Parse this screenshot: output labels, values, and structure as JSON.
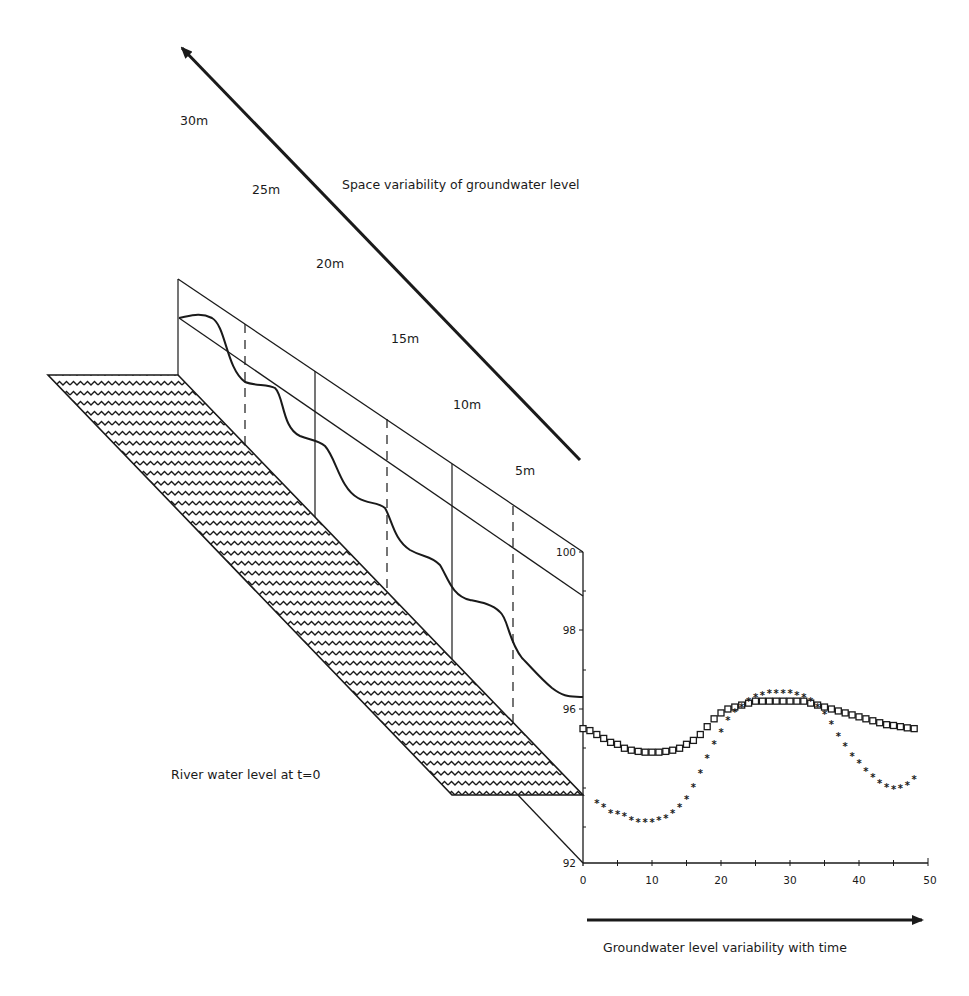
{
  "figure": {
    "top_arrow_label": "Space variability of groundwater level",
    "bottom_arrow_label": "Groundwater level variability with time",
    "river_label": "River water level at t=0",
    "distance_markers": [
      {
        "label": "30m",
        "x": 178,
        "line": "solid"
      },
      {
        "label": "25m",
        "x": 245,
        "line": "dashed"
      },
      {
        "label": "20m",
        "x": 315,
        "line": "solid"
      },
      {
        "label": "15m",
        "x": 387,
        "line": "dashed"
      },
      {
        "label": "10m",
        "x": 452,
        "line": "solid"
      },
      {
        "label": "5m",
        "x": 513,
        "line": "dashed"
      }
    ],
    "colors": {
      "ink": "#1a1a1a",
      "background": "#ffffff"
    }
  },
  "chart_data": {
    "type": "scatter",
    "title": "",
    "xlabel": "Groundwater level variability with time",
    "ylabel": "",
    "xlim": [
      0,
      50
    ],
    "ylim": [
      92,
      100
    ],
    "x_ticks": [
      "0",
      "10",
      "20",
      "30",
      "40",
      "50"
    ],
    "y_ticks": [
      "92",
      "96",
      "98",
      "100"
    ],
    "grid": false,
    "legend": null,
    "series": [
      {
        "name": "square-markers",
        "marker": "square",
        "x": [
          0,
          1,
          2,
          3,
          4,
          5,
          6,
          7,
          8,
          9,
          10,
          11,
          12,
          13,
          14,
          15,
          16,
          17,
          18,
          19,
          20,
          21,
          22,
          23,
          24,
          25,
          26,
          27,
          28,
          29,
          30,
          31,
          32,
          33,
          34,
          35,
          36,
          37,
          38,
          39,
          40,
          41,
          42,
          43,
          44,
          45,
          46,
          47,
          48
        ],
        "values": [
          95.5,
          95.45,
          95.35,
          95.25,
          95.15,
          95.1,
          95.0,
          94.95,
          94.92,
          94.9,
          94.9,
          94.9,
          94.92,
          94.95,
          95.0,
          95.1,
          95.2,
          95.35,
          95.55,
          95.75,
          95.9,
          96.0,
          96.05,
          96.1,
          96.15,
          96.2,
          96.2,
          96.2,
          96.2,
          96.2,
          96.2,
          96.2,
          96.2,
          96.15,
          96.1,
          96.05,
          96.0,
          95.95,
          95.9,
          95.85,
          95.8,
          95.75,
          95.7,
          95.65,
          95.6,
          95.58,
          95.55,
          95.52,
          95.5
        ]
      },
      {
        "name": "star-markers",
        "marker": "star",
        "x": [
          2,
          3,
          4,
          5,
          6,
          7,
          8,
          9,
          10,
          11,
          12,
          13,
          14,
          15,
          16,
          17,
          18,
          19,
          20,
          21,
          22,
          23,
          24,
          25,
          26,
          27,
          28,
          29,
          30,
          31,
          32,
          33,
          34,
          35,
          36,
          37,
          38,
          39,
          40,
          41,
          42,
          43,
          44,
          45,
          46,
          47,
          48
        ],
        "values": [
          93.6,
          93.5,
          93.35,
          93.3,
          93.25,
          93.15,
          93.1,
          93.1,
          93.1,
          93.15,
          93.2,
          93.35,
          93.5,
          93.7,
          94.0,
          94.35,
          94.75,
          95.1,
          95.4,
          95.7,
          95.9,
          96.05,
          96.2,
          96.3,
          96.35,
          96.4,
          96.4,
          96.4,
          96.4,
          96.35,
          96.3,
          96.2,
          96.05,
          95.85,
          95.6,
          95.3,
          95.05,
          94.8,
          94.6,
          94.4,
          94.25,
          94.1,
          94.0,
          93.95,
          93.97,
          94.05,
          94.2
        ]
      }
    ],
    "spatial_profile": {
      "description": "Groundwater level along distance from river",
      "distance_labels": [
        "30m",
        "25m",
        "20m",
        "15m",
        "10m",
        "5m"
      ]
    }
  }
}
